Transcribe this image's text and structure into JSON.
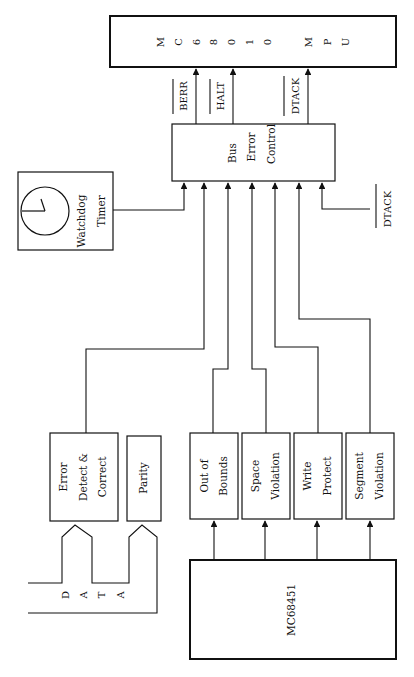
{
  "diagram": {
    "orientation": "rotated 90deg counter-clockwise (text reads bottom-to-top)",
    "blocks": {
      "mpu": {
        "label_letters": [
          "M",
          "C",
          "6",
          "8",
          "0",
          "1",
          "0",
          "",
          "M",
          "P",
          "U"
        ],
        "label": "MC68010 MPU"
      },
      "bus_error_control": {
        "lines": [
          "Bus",
          "Error",
          "Control"
        ]
      },
      "watchdog_timer": {
        "lines": [
          "Watchdog",
          "Timer"
        ],
        "icon": "clock-icon"
      },
      "error_detect_correct": {
        "lines": [
          "Error",
          "Detect &",
          "Correct"
        ]
      },
      "parity": {
        "lines": [
          "Parity"
        ]
      },
      "out_of_bounds": {
        "lines": [
          "Out of",
          "Bounds"
        ]
      },
      "space_violation": {
        "lines": [
          "Space",
          "Violation"
        ]
      },
      "write_protect": {
        "lines": [
          "Write",
          "Protect"
        ]
      },
      "segment_violation": {
        "lines": [
          "Segment",
          "Violation"
        ]
      },
      "mmu": {
        "label": "MC68451"
      }
    },
    "signals": {
      "berr": "BERR",
      "halt": "HALT",
      "dtack_out": "DTACK",
      "dtack_in": "DTACK"
    },
    "data_bus": {
      "letters": [
        "D",
        "A",
        "T",
        "A"
      ]
    }
  }
}
